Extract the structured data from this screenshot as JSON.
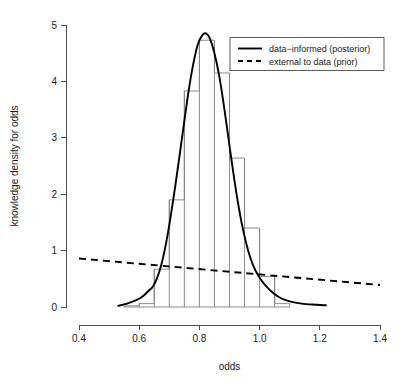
{
  "chart_data": {
    "type": "area",
    "title": "",
    "xlabel": "odds",
    "ylabel": "knowledge density for odds",
    "xlim": [
      0.4,
      1.4
    ],
    "ylim": [
      0,
      5
    ],
    "grid": false,
    "legend_position": "top-right",
    "x_ticks": [
      {
        "value": 0.4,
        "label": "0.4"
      },
      {
        "value": 0.6,
        "label": "0.6"
      },
      {
        "value": 0.8,
        "label": "0.8"
      },
      {
        "value": 1.0,
        "label": "1.0"
      },
      {
        "value": 1.2,
        "label": "1.2"
      },
      {
        "value": 1.4,
        "label": "1.4"
      }
    ],
    "y_ticks": [
      {
        "value": 0,
        "label": "0"
      },
      {
        "value": 1,
        "label": "1"
      },
      {
        "value": 2,
        "label": "2"
      },
      {
        "value": 3,
        "label": "3"
      },
      {
        "value": 4,
        "label": "4"
      },
      {
        "value": 5,
        "label": "5"
      }
    ],
    "x_axis_range_drawn": [
      0.4,
      1.4
    ],
    "y_axis_range_drawn": [
      0,
      5
    ],
    "legend": [
      {
        "label": "data−informed (posterior)",
        "style": "solid",
        "color": "#000000"
      },
      {
        "label": "external to data (prior)",
        "style": "dashed",
        "color": "#000000"
      }
    ],
    "series": [
      {
        "name": "histogram",
        "type": "histogram",
        "bin_width": 0.05,
        "bin_edges": [
          0.55,
          0.6,
          0.65,
          0.7,
          0.75,
          0.8,
          0.85,
          0.9,
          0.95,
          1.0,
          1.05,
          1.1
        ],
        "values": [
          0.02,
          0.06,
          0.67,
          1.9,
          3.83,
          4.73,
          4.15,
          2.64,
          1.4,
          0.54,
          0.06
        ]
      },
      {
        "name": "data−informed (posterior)",
        "type": "line",
        "style": "solid",
        "x": [
          0.53,
          0.56,
          0.59,
          0.61,
          0.63,
          0.645,
          0.66,
          0.675,
          0.69,
          0.705,
          0.72,
          0.735,
          0.75,
          0.765,
          0.78,
          0.795,
          0.81,
          0.822,
          0.835,
          0.85,
          0.865,
          0.88,
          0.895,
          0.91,
          0.925,
          0.94,
          0.955,
          0.97,
          0.985,
          1.0,
          1.02,
          1.045,
          1.07,
          1.1,
          1.14,
          1.19,
          1.22
        ],
        "y": [
          0.02,
          0.06,
          0.12,
          0.18,
          0.28,
          0.36,
          0.52,
          0.78,
          1.15,
          1.62,
          2.15,
          2.72,
          3.3,
          3.86,
          4.32,
          4.66,
          4.82,
          4.85,
          4.76,
          4.5,
          4.12,
          3.62,
          3.05,
          2.48,
          1.95,
          1.5,
          1.14,
          0.86,
          0.66,
          0.52,
          0.38,
          0.25,
          0.16,
          0.1,
          0.06,
          0.04,
          0.03
        ]
      },
      {
        "name": "external to data (prior)",
        "type": "line",
        "style": "dashed",
        "x": [
          0.4,
          1.4
        ],
        "y": [
          0.86,
          0.39
        ]
      }
    ]
  }
}
